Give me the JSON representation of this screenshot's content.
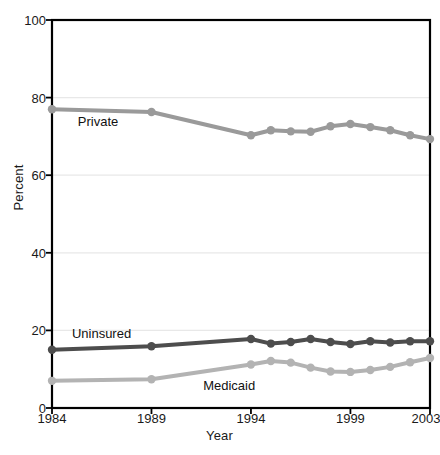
{
  "chart_data": {
    "type": "line",
    "title": "",
    "xlabel": "Year",
    "ylabel": "Percent",
    "xlim": [
      1984,
      2003
    ],
    "ylim": [
      0,
      100
    ],
    "yticks": [
      0,
      20,
      40,
      60,
      80,
      100
    ],
    "xticks": [
      1984,
      1989,
      1994,
      1999,
      2003
    ],
    "grid": "horizontal",
    "legend_position": "inline-labels",
    "x": [
      1984,
      1989,
      1994,
      1995,
      1996,
      1997,
      1998,
      1999,
      2000,
      2001,
      2002,
      2003
    ],
    "series": [
      {
        "name": "Private",
        "color": "#9a9a9a",
        "values": [
          77.0,
          76.3,
          70.3,
          71.6,
          71.3,
          71.2,
          72.6,
          73.2,
          72.4,
          71.6,
          70.3,
          69.3
        ]
      },
      {
        "name": "Uninsured",
        "color": "#4d4d4d",
        "values": [
          15.0,
          15.9,
          17.8,
          16.6,
          17.0,
          17.8,
          17.0,
          16.5,
          17.2,
          16.9,
          17.2,
          17.2
        ]
      },
      {
        "name": "Medicaid",
        "color": "#b3b3b3",
        "values": [
          7.0,
          7.4,
          11.2,
          12.1,
          11.7,
          10.4,
          9.4,
          9.3,
          9.8,
          10.6,
          11.8,
          12.9
        ]
      }
    ],
    "annotations": [
      {
        "text": "Private",
        "x": 1985.3,
        "y": 73.8
      },
      {
        "text": "Uninsured",
        "x": 1985.0,
        "y": 19.2
      },
      {
        "text": "Medicaid",
        "x": 1991.6,
        "y": 5.6
      }
    ]
  },
  "axis": {
    "ylabel": "Percent",
    "xlabel": "Year",
    "ytick_labels": [
      "0",
      "20",
      "40",
      "60",
      "80",
      "100"
    ],
    "xtick_labels": [
      "1984",
      "1989",
      "1994",
      "1999",
      "2003"
    ]
  },
  "colors": {
    "private": "#9a9a9a",
    "uninsured": "#4d4d4d",
    "medicaid": "#b3b3b3",
    "axis": "#000000",
    "grid": "#e8e8e8"
  }
}
